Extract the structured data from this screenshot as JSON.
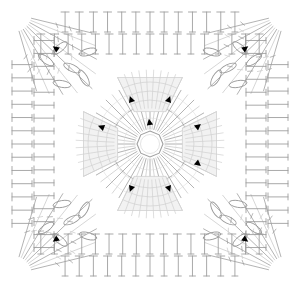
{
  "document": {
    "title": "Crochet Granny Square Stitch Chart",
    "kind": "crochet-pattern-diagram",
    "width": 300,
    "height": 288,
    "background": "#ffffff"
  },
  "palette": {
    "stitch_line": "#9a9a9a",
    "stitch_line_light": "#c8c8c8",
    "stitch_line_faint": "#dcdcdc",
    "petal_fill": "#f2f2f2",
    "petal_stroke": "#d0d0d0",
    "marker": "#000000",
    "center_ring": "#a0a0a0"
  },
  "geometry": {
    "center_x": 150,
    "center_y": 144,
    "center_ring_radius": 13,
    "spoke_count": 48,
    "spoke_inner_radius": 15,
    "spoke_outer_radius": 62,
    "petal_count": 4,
    "corner_count": 4
  },
  "chart_data": {
    "type": "diagram",
    "title": "Crochet Granny Square Stitch Chart",
    "rounds": [
      {
        "index": 1,
        "name": "magic-ring",
        "symbol": "ring",
        "stitch_count": 8,
        "radius": 13
      },
      {
        "index": 2,
        "name": "spoke-burst",
        "symbol": "double-crochet",
        "stitch_count": 48,
        "radius": 62
      },
      {
        "index": 3,
        "name": "petal-blocks",
        "symbol": "shell-block",
        "stitch_count": 4,
        "radius": 72
      },
      {
        "index": 4,
        "name": "corner-fans",
        "symbol": "treble-crochet-fan",
        "stitch_count": 4,
        "radius": 96
      },
      {
        "index": 5,
        "name": "border-row-inner",
        "symbol": "double-crochet",
        "stitch_count": 44,
        "radius": 110
      },
      {
        "index": 6,
        "name": "border-row-outer",
        "symbol": "double-crochet",
        "stitch_count": 52,
        "radius": 132
      }
    ],
    "edges": {
      "top": {
        "stitch_rows": 2,
        "stitches_per_row": 13,
        "symbol": "double-crochet"
      },
      "bottom": {
        "stitch_rows": 2,
        "stitches_per_row": 13,
        "symbol": "double-crochet"
      },
      "left": {
        "stitch_rows": 2,
        "stitches_per_row": 13,
        "symbol": "double-crochet"
      },
      "right": {
        "stitch_rows": 2,
        "stitches_per_row": 13,
        "symbol": "double-crochet"
      }
    },
    "markers": {
      "symbol": "direction-arrow",
      "color": "#000000",
      "count": 12,
      "positions": [
        {
          "x": 104,
          "y": 128,
          "rot": 200
        },
        {
          "x": 150,
          "y": 125,
          "rot": 260
        },
        {
          "x": 196,
          "y": 128,
          "rot": 320
        },
        {
          "x": 132,
          "y": 102,
          "rot": 250
        },
        {
          "x": 168,
          "y": 102,
          "rot": 290
        },
        {
          "x": 132,
          "y": 186,
          "rot": 110
        },
        {
          "x": 168,
          "y": 186,
          "rot": 70
        },
        {
          "x": 196,
          "y": 162,
          "rot": 40
        },
        {
          "x": 58,
          "y": 50,
          "rot": 215
        },
        {
          "x": 243,
          "y": 50,
          "rot": 325
        },
        {
          "x": 58,
          "y": 238,
          "rot": 145
        },
        {
          "x": 243,
          "y": 238,
          "rot": 35
        }
      ]
    },
    "chain_loops": {
      "symbol": "chain-oval",
      "count": 16,
      "note": "oval chain-stitch symbols clustered at the four corners"
    }
  },
  "legend": {
    "visible": false,
    "entries": [
      {
        "symbol": "T",
        "name": "double crochet"
      },
      {
        "symbol": "oval",
        "name": "chain stitch"
      },
      {
        "symbol": "arrow",
        "name": "direction of work"
      }
    ]
  }
}
